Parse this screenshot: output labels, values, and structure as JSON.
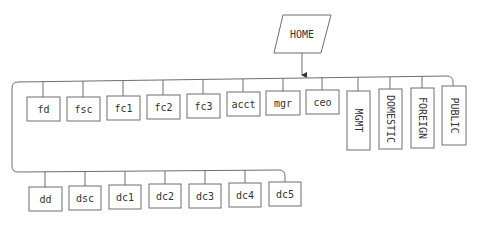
{
  "diagram": {
    "title": "",
    "colors": {
      "stroke": "#6e6e6e",
      "text": "#333333",
      "background": "#ffffff"
    },
    "root": {
      "id": "home",
      "label": "HOME",
      "shape": "parallelogram"
    },
    "top_row": [
      {
        "id": "fd",
        "label": "fd",
        "orientation": "horizontal"
      },
      {
        "id": "fsc",
        "label": "fsc",
        "orientation": "horizontal"
      },
      {
        "id": "fc1",
        "label": "fc1",
        "orientation": "horizontal"
      },
      {
        "id": "fc2",
        "label": "fc2",
        "orientation": "horizontal"
      },
      {
        "id": "fc3",
        "label": "fc3",
        "orientation": "horizontal"
      },
      {
        "id": "acct",
        "label": "acct",
        "orientation": "horizontal"
      },
      {
        "id": "mgr",
        "label": "mgr",
        "orientation": "horizontal"
      },
      {
        "id": "ceo",
        "label": "ceo",
        "orientation": "horizontal"
      },
      {
        "id": "mgmt",
        "label": "MGMT",
        "orientation": "vertical"
      },
      {
        "id": "domestic",
        "label": "DOMESTIC",
        "orientation": "vertical"
      },
      {
        "id": "foreign",
        "label": "FOREIGN",
        "orientation": "vertical"
      },
      {
        "id": "public",
        "label": "PUBLIC",
        "orientation": "vertical"
      }
    ],
    "bottom_row": [
      {
        "id": "dd",
        "label": "dd"
      },
      {
        "id": "dsc",
        "label": "dsc"
      },
      {
        "id": "dc1",
        "label": "dc1"
      },
      {
        "id": "dc2",
        "label": "dc2"
      },
      {
        "id": "dc3",
        "label": "dc3"
      },
      {
        "id": "dc4",
        "label": "dc4"
      },
      {
        "id": "dc5",
        "label": "dc5"
      }
    ],
    "edges": [
      {
        "from": "home",
        "to": "top_row_bus",
        "arrow": true
      },
      {
        "from": "top_row_bus",
        "to": "bottom_row_bus",
        "arrow": false
      }
    ]
  }
}
